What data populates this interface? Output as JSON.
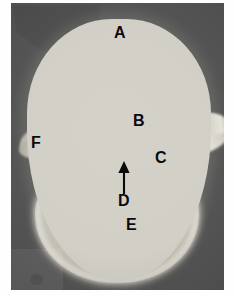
{
  "figure": {
    "kind": "anatomical-photograph",
    "orientation": "superior (axial) view",
    "plate_background_color": "#545454",
    "bone_color": "#d2cfc6",
    "annotation_color": "#0a0a0a",
    "paper_color": "#fefefe"
  },
  "labels": [
    {
      "id": "a",
      "text": "A",
      "structure": "spinous process"
    },
    {
      "id": "b",
      "text": "B",
      "structure": "lamina"
    },
    {
      "id": "c",
      "text": "C",
      "structure": "pedicle"
    },
    {
      "id": "d",
      "text": "D",
      "structure": "vertebral foramen"
    },
    {
      "id": "e",
      "text": "E",
      "structure": "vertebral body"
    },
    {
      "id": "f",
      "text": "F",
      "structure": "transverse process"
    }
  ],
  "annotations": {
    "arrow_d": {
      "name": "leader-arrow",
      "points_to": "vertebral foramen",
      "direction": "up",
      "color": "#0a0a0a"
    }
  }
}
